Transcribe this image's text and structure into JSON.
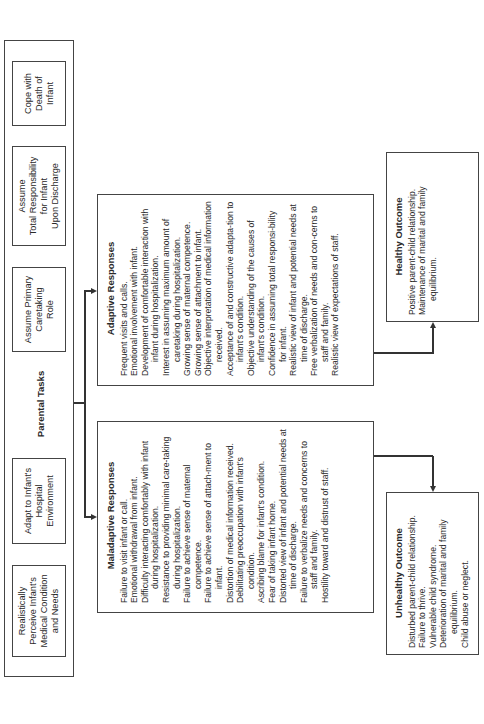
{
  "diagram": {
    "orientation": "rotated 90 degrees counter-clockwise",
    "parental_tasks": {
      "title": "Parental Tasks",
      "tasks": [
        {
          "label": "Realistically\nPerceive Infant's\nMedical Condition\nand Needs"
        },
        {
          "label": "Adapt to Infant's\nHospital\nEnvironment"
        },
        {
          "label": "Assume Primary\nCaretaking\nRole"
        },
        {
          "label": "Assume\nTotal Responsibility\nfor Infant\nUpon Discharge"
        },
        {
          "label": "Cope with\nDeath of\nInfant"
        }
      ]
    },
    "maladaptive": {
      "title": "Maladaptive Responses",
      "items": [
        "Failure to visit infant or call.",
        "Emotional withdrawal from infant.",
        "Difficulty interacting comfortably with infant during hospitalization.",
        "Resistance to providing minimal care-taking during hospitalization.",
        "Failure to achieve sense of maternal competence.",
        "Failure to achieve sense of attach-ment to infant.",
        "Distortion of medical information received.",
        "Debilitating preoccupation with infant's condition.",
        "Ascribing blame for infant's condition.",
        "Fear of taking infant home.",
        "Distorted view of infant and potential needs at time of discharge.",
        "Failure to verbalize needs and concerns to staff and family.",
        "Hostility toward and distrust of staff."
      ]
    },
    "adaptive": {
      "title": "Adaptive Responses",
      "items": [
        "Frequent visits and calls.",
        "Emotional involvement with infant.",
        "Development of comfortable interaction with infant during hospitalization.",
        "Interest in assuming maximum amount of caretaking during hospitalization.",
        "Growing sense of maternal competence.",
        "Growing sense of attachment to infant.",
        "Objective interpretation of medical information received.",
        "Acceptance of and constructive adapta-tion to infant's condition.",
        "Objective understanding of the causes of infant's condition.",
        "Confidence in assuming total responsi-bility for infant.",
        "Realistic view of infant and potential needs at time of discharge.",
        "Free verbalization of needs and con-cerns to staff and family.",
        "Realistic view of expectations of staff."
      ]
    },
    "unhealthy": {
      "title": "Unhealthy Outcome",
      "items": [
        "Disturbed parent-child relationship.",
        "Failure to thrive.",
        "Vulnerable child syndrome.",
        "Deterioration of marital and family equilibrium.",
        "Child abuse or neglect."
      ]
    },
    "healthy": {
      "title": "Healthy Outcome",
      "items": [
        "Positive parent-child relationship.",
        "Maintenance of marital and family equilibrium."
      ]
    }
  }
}
